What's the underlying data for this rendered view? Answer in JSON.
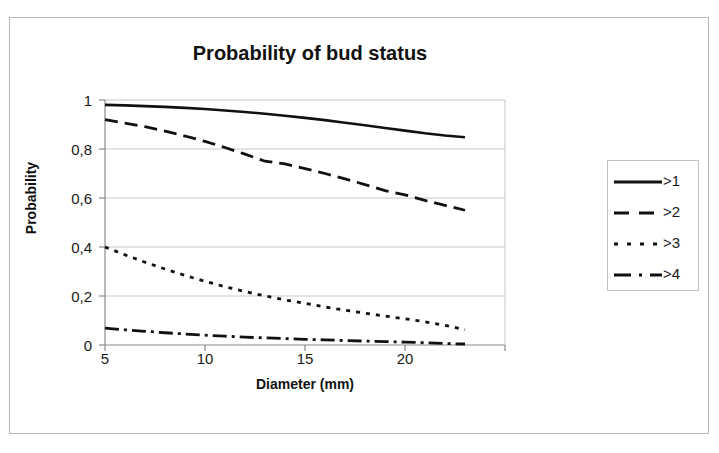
{
  "chart_data": {
    "type": "line",
    "title": "Probability of bud status",
    "xlabel": "Diameter (mm)",
    "ylabel": "Probability",
    "xlim": [
      5,
      25
    ],
    "ylim": [
      0,
      1
    ],
    "xticks": [
      "5",
      "10",
      "15",
      "20"
    ],
    "xtick_values": [
      5,
      10,
      15,
      20
    ],
    "yticks": [
      "0",
      "0,2",
      "0,4",
      "0,6",
      "0,8",
      "1"
    ],
    "ytick_values": [
      0,
      0.2,
      0.4,
      0.6,
      0.8,
      1
    ],
    "grid": "horizontal",
    "legend_position": "right",
    "decimal_separator": ",",
    "x": [
      5,
      6,
      7,
      8,
      9,
      10,
      11,
      12,
      13,
      14,
      15,
      16,
      17,
      18,
      19,
      20,
      21,
      22,
      23
    ],
    "series": [
      {
        "name": ">1",
        "style": "solid",
        "values": [
          0.98,
          0.978,
          0.975,
          0.972,
          0.968,
          0.963,
          0.957,
          0.951,
          0.944,
          0.936,
          0.927,
          0.918,
          0.907,
          0.897,
          0.886,
          0.875,
          0.864,
          0.855,
          0.848
        ]
      },
      {
        "name": ">2",
        "style": "dashed",
        "values": [
          0.92,
          0.906,
          0.891,
          0.873,
          0.853,
          0.831,
          0.806,
          0.779,
          0.75,
          0.739,
          0.72,
          0.7,
          0.678,
          0.655,
          0.63,
          0.613,
          0.59,
          0.57,
          0.55
        ]
      },
      {
        "name": ">3",
        "style": "dotted",
        "values": [
          0.4,
          0.368,
          0.338,
          0.31,
          0.284,
          0.26,
          0.238,
          0.218,
          0.2,
          0.184,
          0.17,
          0.155,
          0.142,
          0.13,
          0.118,
          0.107,
          0.095,
          0.08,
          0.063
        ]
      },
      {
        "name": ">4",
        "style": "dashdot",
        "values": [
          0.069,
          0.062,
          0.056,
          0.05,
          0.045,
          0.04,
          0.036,
          0.032,
          0.029,
          0.026,
          0.023,
          0.021,
          0.018,
          0.016,
          0.014,
          0.012,
          0.009,
          0.006,
          0.004
        ]
      }
    ]
  },
  "colors": {
    "line": "#111111",
    "grid": "#c8c8c8",
    "axis": "#8a8a8a",
    "frame": "#b8b8b8",
    "text": "#1a1a1a"
  }
}
